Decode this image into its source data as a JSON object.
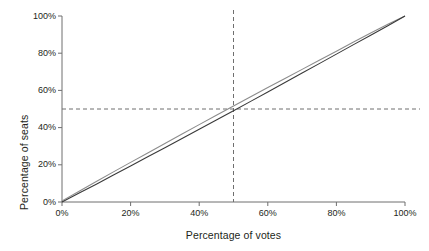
{
  "chart_data": {
    "type": "line",
    "title": "",
    "subtitle": "",
    "xlabel": "Percentage of votes",
    "ylabel": "Percentage of seats",
    "xlim": [
      0,
      100
    ],
    "ylim": [
      0,
      100
    ],
    "xticks": [
      0,
      20,
      40,
      60,
      80,
      100
    ],
    "yticks": [
      0,
      20,
      40,
      60,
      80,
      100
    ],
    "xticklabels": [
      "0%",
      "20%",
      "40%",
      "60%",
      "80%",
      "100%"
    ],
    "yticklabels": [
      "0%",
      "20%",
      "40%",
      "60%",
      "80%",
      "100%"
    ],
    "grid": false,
    "legend": "none",
    "series": [
      {
        "name": "upper-curve",
        "color": "#8c8c8c",
        "x": [
          0,
          5,
          10,
          15,
          20,
          25,
          30,
          35,
          40,
          45,
          50,
          55,
          60,
          65,
          70,
          75,
          80,
          85,
          90,
          95,
          100
        ],
        "values": [
          0.6,
          5.8,
          11.0,
          16.2,
          21.3,
          26.4,
          31.5,
          36.6,
          41.6,
          46.6,
          51.6,
          56.6,
          61.5,
          66.4,
          71.3,
          76.2,
          81.1,
          86.0,
          90.8,
          95.6,
          100.0
        ]
      },
      {
        "name": "lower-curve",
        "color": "#3a3a3a",
        "x": [
          0,
          5,
          10,
          15,
          20,
          25,
          30,
          35,
          40,
          45,
          50,
          55,
          60,
          65,
          70,
          75,
          80,
          85,
          90,
          95,
          100
        ],
        "values": [
          0.0,
          4.8,
          9.6,
          14.5,
          19.4,
          24.3,
          29.2,
          34.1,
          39.1,
          44.1,
          49.1,
          54.1,
          59.1,
          64.2,
          69.3,
          74.4,
          79.5,
          84.6,
          89.7,
          94.8,
          100.0
        ]
      }
    ],
    "annotations": [
      {
        "name": "vertical-reference-line",
        "orientation": "vertical",
        "value": 50,
        "label": "50% of votes",
        "style": "dashed",
        "color": "#6f6f6f"
      },
      {
        "name": "horizontal-reference-line",
        "orientation": "horizontal",
        "value": 50,
        "label": "50% of seats",
        "style": "dashed",
        "color": "#6f6f6f"
      }
    ],
    "axis_color": "#6f6f6f",
    "text_color": "#231f20",
    "background": "#ffffff"
  }
}
